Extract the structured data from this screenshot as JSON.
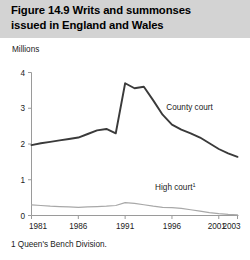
{
  "figure": {
    "title_line_1": "Figure 14.9  Writs and summonses",
    "title_line_2": "issued in England and Wales",
    "unit_label": "Millions",
    "footnote": "1 Queen's Bench Division.",
    "band_color": "#d3d3d3"
  },
  "chart_data": {
    "type": "line",
    "title": "Figure 14.9  Writs and summonses issued in England and Wales",
    "xlabel": "",
    "ylabel": "Millions",
    "ylim": [
      0,
      4
    ],
    "xlim": [
      1981,
      2003
    ],
    "yticks": [
      "0",
      "1",
      "2",
      "3",
      "4"
    ],
    "ytick_values": [
      0,
      1,
      2,
      3,
      4
    ],
    "xticks": [
      "1981",
      "1986",
      "1991",
      "1996",
      "2001",
      "2003"
    ],
    "xtick_values": [
      1981,
      1986,
      1991,
      1996,
      2001,
      2003
    ],
    "grid": false,
    "legend_position": "inline-annotation",
    "x": [
      1981,
      1982,
      1983,
      1984,
      1985,
      1986,
      1987,
      1988,
      1989,
      1990,
      1991,
      1992,
      1993,
      1994,
      1995,
      1996,
      1997,
      1998,
      1999,
      2000,
      2001,
      2002,
      2003
    ],
    "series": [
      {
        "name": "County court",
        "color": "#3a3a3a",
        "width": 1.9,
        "label": "County court",
        "values": [
          1.97,
          2.02,
          2.06,
          2.1,
          2.14,
          2.18,
          2.28,
          2.38,
          2.42,
          2.3,
          3.7,
          3.56,
          3.6,
          3.22,
          2.82,
          2.54,
          2.4,
          2.3,
          2.18,
          2.02,
          1.86,
          1.74,
          1.64
        ]
      },
      {
        "name": "High court",
        "color": "#a8a8a8",
        "width": 1.2,
        "label": "High court",
        "label_superscript": "1",
        "values": [
          0.3,
          0.28,
          0.26,
          0.25,
          0.24,
          0.23,
          0.24,
          0.25,
          0.26,
          0.28,
          0.36,
          0.34,
          0.3,
          0.26,
          0.23,
          0.22,
          0.2,
          0.16,
          0.12,
          0.08,
          0.05,
          0.03,
          0.02
        ]
      }
    ],
    "annotations": [
      {
        "text": "County court",
        "x": 1995.4,
        "y": 2.95
      },
      {
        "text": "High court",
        "superscript": "1",
        "x": 1994.2,
        "y": 0.72
      }
    ]
  }
}
